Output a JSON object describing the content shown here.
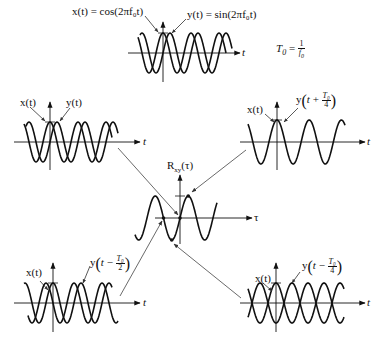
{
  "diagram": {
    "period_definition": {
      "lhs": "T",
      "lhs_sub": "0",
      "num": "1",
      "den": "f",
      "den_sub": "0"
    },
    "plots": {
      "top": {
        "x_label": "x(t) = cos(2πf₀t)",
        "y_label": "y(t) = sin(2πf₀t)",
        "axis_label": "t"
      },
      "top_left": {
        "x_label": "x(t)",
        "y_label": "y(t)",
        "axis_label": "t"
      },
      "top_right": {
        "x_label": "x(t)",
        "y_label_prefix": "y",
        "y_label_shift_sign": "+",
        "y_label_num": "T₀",
        "y_label_den": "4",
        "axis_label": "t"
      },
      "center": {
        "title": "Rxy(τ)",
        "title_main": "R",
        "title_sub": "xy",
        "title_arg": "(τ)",
        "axis_label": "τ"
      },
      "bottom_left": {
        "x_label": "x(t)",
        "y_label_prefix": "y",
        "y_label_shift_sign": "−",
        "y_label_num": "T₀",
        "y_label_den": "2",
        "axis_label": "t"
      },
      "bottom_right": {
        "x_label": "x(t)",
        "y_label_prefix": "y",
        "y_label_shift_sign": "−",
        "y_label_num": "T₀",
        "y_label_den": "4",
        "axis_label": "t"
      }
    },
    "connections": [
      {
        "from": "top_left",
        "to": "center",
        "tau": "0",
        "R_value": "0"
      },
      {
        "from": "top_right",
        "to": "center",
        "tau": "T0/4",
        "R_value": "max"
      },
      {
        "from": "bottom_left",
        "to": "center",
        "tau": "-T0/2",
        "R_value": "0"
      },
      {
        "from": "bottom_right",
        "to": "center",
        "tau": "-T0/4",
        "R_value": "min"
      }
    ],
    "colors": {
      "stroke": "#111111",
      "connector": "#555555",
      "background": "#ffffff"
    }
  }
}
